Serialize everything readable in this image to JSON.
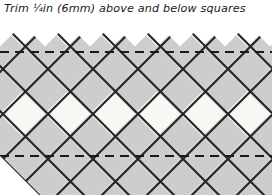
{
  "caption": {
    "full_text": "Trim ¼in (6mm) above and below squares",
    "before_fraction": "Trim ",
    "fraction": "¼",
    "after_fraction": "in (6mm) above and below squares",
    "measurement_imperial": "¼in",
    "measurement_metric": "6mm"
  },
  "diagram": {
    "colors": {
      "square_fill_grey": "#cdcdcd",
      "square_fill_light": "#f7f7f4",
      "outline": "#262626",
      "dashed_line": "#1a1a1a",
      "background": "#ffffff"
    },
    "geometry": {
      "canvas_width": 272,
      "canvas_height": 177,
      "diamond_half_width": 22.5,
      "diamond_half_height": 22.5,
      "peak_row_y": 6,
      "columns": 6,
      "light_row_center_y": 87
    },
    "trim_lines": [
      {
        "name": "upper-trim-line",
        "y": 34,
        "style": "dashed"
      },
      {
        "name": "lower-trim-line",
        "y": 138,
        "style": "dashed"
      }
    ],
    "labels": {
      "upper_trim": "upper trim line",
      "lower_trim": "lower trim line"
    }
  }
}
